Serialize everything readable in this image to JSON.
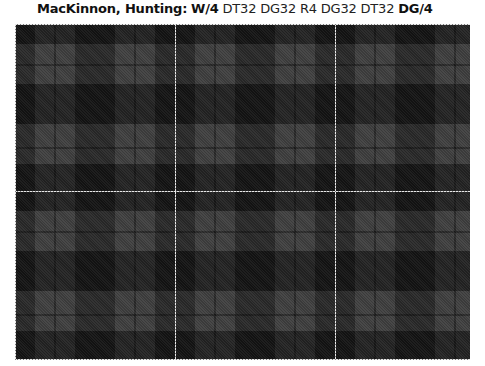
{
  "title": {
    "name": "MacKinnon, Hunting:",
    "threadcount": [
      {
        "text": "W/4",
        "bold": true
      },
      {
        "text": "DT32 DG32 R4 DG32 DT32",
        "bold": false
      },
      {
        "text": "DG/4",
        "bold": true
      }
    ]
  },
  "tartan": {
    "colors": {
      "dark": "#0e0e0e",
      "mid": "#2b2b2b",
      "light": "#454545",
      "pinline_white": "#e8e8e8"
    },
    "sett_width_px": 160,
    "sett_height_px": 167,
    "white_lines_x": [
      175,
      335
    ],
    "white_lines_y": [
      191
    ]
  }
}
